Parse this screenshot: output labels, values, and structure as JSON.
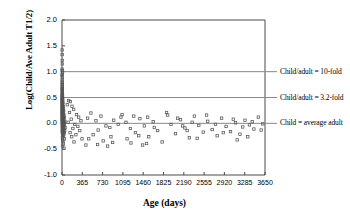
{
  "chart_data": {
    "type": "scatter",
    "title": "",
    "xlabel": "Age (days)",
    "ylabel": "Log(Child/Ave Adult T1/2)",
    "xlim": [
      0,
      3650
    ],
    "ylim": [
      -1.0,
      2.0
    ],
    "xticks": [
      0,
      365,
      730,
      1095,
      1460,
      1825,
      2190,
      2555,
      2920,
      3285,
      3650
    ],
    "xtick_labels": [
      "0",
      "365",
      "730",
      "1095",
      "1460",
      "1825",
      "2190",
      "2555",
      "2920",
      "3285",
      "3650"
    ],
    "yticks": [
      -1.0,
      -0.5,
      0.0,
      0.5,
      1.0,
      1.5,
      2.0
    ],
    "ytick_labels": [
      "-1.0",
      "-0.5",
      "0.0",
      "0.5",
      "1.0",
      "1.5",
      "2.0"
    ],
    "grid": false,
    "legend": "none",
    "marker": "open-square",
    "marker_color": "#555555",
    "reference_lines": [
      {
        "y": 1.0,
        "label": "Child/adult = 10-fold",
        "color": "#888888"
      },
      {
        "y": 0.5,
        "label": "Child/adult = 3.2-fold",
        "color": "#888888"
      },
      {
        "y": 0.0,
        "label": "Child = average adult",
        "color": "#888888"
      }
    ],
    "series": [
      {
        "name": "Child/Ave Adult T1/2 ratio",
        "points": [
          [
            2,
            1.42
          ],
          [
            3,
            1.33
          ],
          [
            4,
            1.22
          ],
          [
            5,
            1.15
          ],
          [
            2,
            1.05
          ],
          [
            3,
            1.02
          ],
          [
            6,
            0.98
          ],
          [
            4,
            0.95
          ],
          [
            2,
            0.92
          ],
          [
            5,
            0.88
          ],
          [
            3,
            0.84
          ],
          [
            7,
            0.8
          ],
          [
            2,
            0.78
          ],
          [
            4,
            0.75
          ],
          [
            6,
            0.72
          ],
          [
            3,
            0.7
          ],
          [
            8,
            0.68
          ],
          [
            2,
            0.66
          ],
          [
            5,
            0.64
          ],
          [
            4,
            0.62
          ],
          [
            7,
            0.6
          ],
          [
            3,
            0.58
          ],
          [
            9,
            0.57
          ],
          [
            2,
            0.55
          ],
          [
            6,
            0.54
          ],
          [
            4,
            0.52
          ],
          [
            11,
            0.51
          ],
          [
            3,
            0.5
          ],
          [
            8,
            0.49
          ],
          [
            5,
            0.48
          ],
          [
            2,
            0.47
          ],
          [
            13,
            0.46
          ],
          [
            7,
            0.45
          ],
          [
            4,
            0.44
          ],
          [
            10,
            0.43
          ],
          [
            3,
            0.42
          ],
          [
            6,
            0.41
          ],
          [
            16,
            0.4
          ],
          [
            5,
            0.39
          ],
          [
            9,
            0.38
          ],
          [
            2,
            0.37
          ],
          [
            12,
            0.36
          ],
          [
            4,
            0.35
          ],
          [
            7,
            0.34
          ],
          [
            20,
            0.33
          ],
          [
            3,
            0.32
          ],
          [
            14,
            0.31
          ],
          [
            6,
            0.3
          ],
          [
            5,
            0.29
          ],
          [
            25,
            0.285
          ],
          [
            8,
            0.28
          ],
          [
            4,
            0.27
          ],
          [
            11,
            0.26
          ],
          [
            3,
            0.25
          ],
          [
            30,
            0.245
          ],
          [
            7,
            0.24
          ],
          [
            18,
            0.23
          ],
          [
            5,
            0.22
          ],
          [
            9,
            0.21
          ],
          [
            2,
            0.205
          ],
          [
            22,
            0.2
          ],
          [
            6,
            0.19
          ],
          [
            13,
            0.18
          ],
          [
            4,
            0.175
          ],
          [
            35,
            0.17
          ],
          [
            8,
            0.16
          ],
          [
            16,
            0.155
          ],
          [
            3,
            0.15
          ],
          [
            10,
            0.14
          ],
          [
            28,
            0.135
          ],
          [
            5,
            0.13
          ],
          [
            19,
            0.12
          ],
          [
            7,
            0.115
          ],
          [
            42,
            0.11
          ],
          [
            12,
            0.1
          ],
          [
            4,
            0.095
          ],
          [
            24,
            0.09
          ],
          [
            9,
            0.08
          ],
          [
            15,
            0.075
          ],
          [
            2,
            0.07
          ],
          [
            33,
            0.065
          ],
          [
            6,
            0.06
          ],
          [
            20,
            0.05
          ],
          [
            11,
            0.045
          ],
          [
            50,
            0.04
          ],
          [
            8,
            0.03
          ],
          [
            27,
            0.025
          ],
          [
            14,
            0.02
          ],
          [
            3,
            0.015
          ],
          [
            38,
            0.01
          ],
          [
            17,
            0.005
          ],
          [
            5,
            0.0
          ],
          [
            22,
            -0.01
          ],
          [
            10,
            -0.02
          ],
          [
            45,
            -0.025
          ],
          [
            7,
            -0.03
          ],
          [
            30,
            -0.04
          ],
          [
            13,
            -0.05
          ],
          [
            4,
            -0.055
          ],
          [
            25,
            -0.06
          ],
          [
            9,
            -0.07
          ],
          [
            18,
            -0.08
          ],
          [
            55,
            -0.085
          ],
          [
            6,
            -0.09
          ],
          [
            35,
            -0.1
          ],
          [
            12,
            -0.11
          ],
          [
            21,
            -0.12
          ],
          [
            3,
            -0.13
          ],
          [
            48,
            -0.14
          ],
          [
            8,
            -0.15
          ],
          [
            28,
            -0.16
          ],
          [
            15,
            -0.17
          ],
          [
            40,
            -0.18
          ],
          [
            5,
            -0.19
          ],
          [
            19,
            -0.2
          ],
          [
            32,
            -0.22
          ],
          [
            10,
            -0.24
          ],
          [
            24,
            -0.26
          ],
          [
            7,
            -0.28
          ],
          [
            44,
            -0.3
          ],
          [
            13,
            -0.33
          ],
          [
            17,
            -0.36
          ],
          [
            26,
            -0.4
          ],
          [
            9,
            -0.44
          ],
          [
            36,
            -0.48
          ],
          [
            120,
            0.44
          ],
          [
            150,
            0.42
          ],
          [
            95,
            0.36
          ],
          [
            180,
            0.33
          ],
          [
            210,
            0.27
          ],
          [
            135,
            0.21
          ],
          [
            260,
            0.17
          ],
          [
            300,
            0.12
          ],
          [
            165,
            0.08
          ],
          [
            340,
            0.05
          ],
          [
            110,
            0.02
          ],
          [
            230,
            -0.02
          ],
          [
            285,
            -0.06
          ],
          [
            195,
            -0.1
          ],
          [
            320,
            -0.14
          ],
          [
            145,
            -0.18
          ],
          [
            250,
            -0.22
          ],
          [
            175,
            -0.26
          ],
          [
            360,
            -0.3
          ],
          [
            215,
            -0.36
          ],
          [
            460,
            0.1
          ],
          [
            520,
            0.2
          ],
          [
            610,
            0.05
          ],
          [
            700,
            0.14
          ],
          [
            790,
            -0.05
          ],
          [
            650,
            -0.13
          ],
          [
            560,
            -0.22
          ],
          [
            860,
            -0.08
          ],
          [
            930,
            0.06
          ],
          [
            1010,
            -0.02
          ],
          [
            480,
            -0.3
          ],
          [
            740,
            -0.34
          ],
          [
            880,
            -0.26
          ],
          [
            1080,
            0.17
          ],
          [
            1150,
            0.02
          ],
          [
            1230,
            -0.1
          ],
          [
            1320,
            -0.18
          ],
          [
            1400,
            0.09
          ],
          [
            1480,
            -0.05
          ],
          [
            1560,
            -0.26
          ],
          [
            1640,
            0.03
          ],
          [
            1720,
            -0.14
          ],
          [
            1800,
            -0.36
          ],
          [
            1880,
            0.21
          ],
          [
            1960,
            -0.02
          ],
          [
            2040,
            -0.2
          ],
          [
            2130,
            0.07
          ],
          [
            2210,
            -0.09
          ],
          [
            2290,
            -0.28
          ],
          [
            2380,
            0.14
          ],
          [
            2460,
            -0.04
          ],
          [
            2540,
            -0.17
          ],
          [
            2620,
            0.04
          ],
          [
            2700,
            -0.12
          ],
          [
            2790,
            -0.24
          ],
          [
            2870,
            0.1
          ],
          [
            2950,
            -0.06
          ],
          [
            3030,
            -0.16
          ],
          [
            3120,
            0.01
          ],
          [
            3200,
            -0.21
          ],
          [
            3290,
            0.06
          ],
          [
            3370,
            -0.03
          ],
          [
            3450,
            -0.11
          ],
          [
            3530,
            0.12
          ],
          [
            3610,
            -0.01
          ],
          [
            1060,
            0.12
          ],
          [
            1170,
            -0.3
          ],
          [
            1290,
            0.14
          ],
          [
            1380,
            -0.24
          ],
          [
            1540,
            0.12
          ],
          [
            1660,
            -0.08
          ],
          [
            1900,
            0.16
          ],
          [
            2080,
            0.1
          ],
          [
            2250,
            -0.14
          ],
          [
            2430,
            -0.29
          ],
          [
            2600,
            0.16
          ],
          [
            2760,
            -0.02
          ],
          [
            2900,
            -0.18
          ],
          [
            3080,
            0.08
          ],
          [
            3250,
            -0.07
          ],
          [
            3420,
            0.03
          ],
          [
            3580,
            -0.13
          ],
          [
            1450,
            -0.42
          ],
          [
            1520,
            -0.39
          ],
          [
            1240,
            -0.38
          ],
          [
            640,
            -0.41
          ],
          [
            820,
            -0.44
          ],
          [
            430,
            -0.42
          ],
          [
            910,
            -0.37
          ],
          [
            2170,
            -0.05
          ],
          [
            2340,
            0.02
          ],
          [
            3340,
            -0.26
          ],
          [
            3150,
            -0.32
          ]
        ]
      }
    ]
  },
  "axes": {
    "plot_left_px": 62,
    "plot_right_px": 265,
    "plot_top_px": 20,
    "plot_bottom_px": 175
  }
}
